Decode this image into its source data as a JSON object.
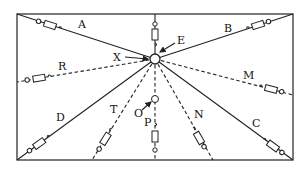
{
  "diagram": {
    "type": "radial wiring / circuit layout",
    "frame": {
      "x": 17,
      "y": 14,
      "width": 276,
      "height": 146
    },
    "hub": {
      "x": 155,
      "y": 59,
      "r": 5
    },
    "labels": {
      "A": "A",
      "B": "B",
      "C": "C",
      "D": "D",
      "E": "E",
      "M": "M",
      "N": "N",
      "O": "O",
      "P": "P",
      "R": "R",
      "T": "T",
      "X": "X"
    },
    "branches": [
      {
        "id": "A",
        "style": "solid",
        "end": "top-left corner"
      },
      {
        "id": "top",
        "style": "solid",
        "end": "top edge"
      },
      {
        "id": "B",
        "style": "solid",
        "end": "top-right corner"
      },
      {
        "id": "R",
        "style": "dashed",
        "end": "left edge"
      },
      {
        "id": "M",
        "style": "dashed",
        "end": "right edge"
      },
      {
        "id": "D",
        "style": "solid",
        "end": "bottom-left corner"
      },
      {
        "id": "T",
        "style": "dashed",
        "end": "bottom edge"
      },
      {
        "id": "P",
        "style": "dashed",
        "end": "bottom edge",
        "node": "O"
      },
      {
        "id": "N",
        "style": "dashed",
        "end": "bottom edge"
      },
      {
        "id": "C",
        "style": "solid",
        "end": "bottom-right corner"
      }
    ],
    "pointers": [
      {
        "label": "X",
        "target": "hub"
      },
      {
        "label": "E",
        "target": "hub"
      },
      {
        "label": "O",
        "target": "node O"
      }
    ]
  }
}
